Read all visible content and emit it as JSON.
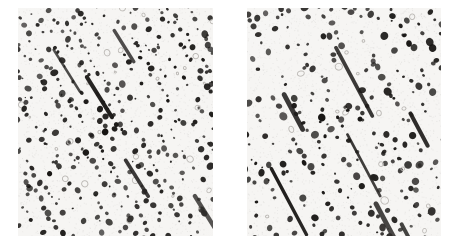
{
  "figure": {
    "type": "micrograph-pair",
    "caption": "",
    "background_color": "#ffffff",
    "panel_background_color": "#f6f5f3",
    "dot_color": "#1c1a18",
    "open_dot_color": "#b9b6b2",
    "width_px": 455,
    "height_px": 243,
    "gap_px": 34
  },
  "panels": [
    {
      "id": "left",
      "name": "micrograph-panel-left",
      "label": "",
      "x": 18,
      "y": 8,
      "width": 195,
      "height": 228,
      "seed": 20417,
      "pattern": {
        "type": "diagonal-etch-pit-rows",
        "line_angle_deg": 58,
        "line_count": 26,
        "line_spacing_px": 13.5,
        "spacing_jitter_px": 3.2,
        "dot_spacing_px": 7.2,
        "dot_spacing_jitter_px": 3.0,
        "dot_radius_px": 2.1,
        "dot_radius_jitter_px": 1.3,
        "dot_offset_jitter_px": 2.6,
        "row_fill_probability": 0.8,
        "open_dot_probability": 0.05,
        "stray_dot_count": 95,
        "streak_count": 5,
        "streak_length_px": 44,
        "streak_width_px": 3.1,
        "grain_opacity": 0.05
      }
    },
    {
      "id": "right",
      "name": "micrograph-panel-right",
      "label": "",
      "x": 247,
      "y": 8,
      "width": 194,
      "height": 228,
      "seed": 77903,
      "pattern": {
        "type": "diagonal-etch-pit-rows",
        "line_angle_deg": 62,
        "line_count": 19,
        "line_spacing_px": 18.5,
        "spacing_jitter_px": 4.0,
        "dot_spacing_px": 8.6,
        "dot_spacing_jitter_px": 3.4,
        "dot_radius_px": 2.5,
        "dot_radius_jitter_px": 1.4,
        "dot_offset_jitter_px": 3.0,
        "row_fill_probability": 0.74,
        "open_dot_probability": 0.055,
        "stray_dot_count": 80,
        "streak_count": 7,
        "streak_length_px": 58,
        "streak_width_px": 3.6,
        "grain_opacity": 0.05
      }
    }
  ]
}
